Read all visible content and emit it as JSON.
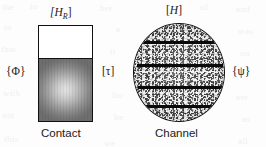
{
  "figure": {
    "width": 266,
    "height": 147,
    "background_color": "#fdfdfd",
    "ink_color": "#101010"
  },
  "contact": {
    "top_label": "[H",
    "top_label_sub": "R",
    "top_label_close": "]",
    "left_label": "{Φ}",
    "right_label": "[τ]",
    "caption": "Contact",
    "shape": "rectangle",
    "upper_region_fill": "#ffffff",
    "lower_region_fill": "radial-gray-gradient",
    "gradient_edge_color": "#6e6e6e",
    "gradient_center_color": "#e2e2e2"
  },
  "channel": {
    "top_label_open": "[",
    "top_label_var": "H",
    "top_label_close": "]",
    "right_label": "{ψ}",
    "caption": "Channel",
    "shape": "circle",
    "texture": "speckled-stipple",
    "bar_color": "#0a0a0a",
    "bar_count": 4,
    "bars": [
      {
        "top": 17,
        "left": 7,
        "width": 78
      },
      {
        "top": 40,
        "left": 3,
        "width": 86
      },
      {
        "top": 62,
        "left": 4,
        "width": 84
      },
      {
        "top": 81,
        "left": 10,
        "width": 72
      }
    ]
  },
  "bleed_through": [
    {
      "text": "the",
      "left": 2,
      "top": 2,
      "size": 9
    },
    {
      "text": "to",
      "left": 30,
      "top": 1,
      "size": 9
    },
    {
      "text": "her",
      "left": 100,
      "top": 3,
      "size": 9
    },
    {
      "text": "of",
      "left": 200,
      "top": 2,
      "size": 9
    },
    {
      "text": "and",
      "left": 236,
      "top": 4,
      "size": 9
    },
    {
      "text": "in",
      "left": 4,
      "top": 22,
      "size": 9
    },
    {
      "text": "a",
      "left": 116,
      "top": 24,
      "size": 9
    },
    {
      "text": "was",
      "left": 238,
      "top": 26,
      "size": 9
    },
    {
      "text": "that",
      "left": 1,
      "top": 44,
      "size": 9
    },
    {
      "text": "it",
      "left": 110,
      "top": 46,
      "size": 9
    },
    {
      "text": "on",
      "left": 240,
      "top": 48,
      "size": 9
    },
    {
      "text": "with",
      "left": 3,
      "top": 88,
      "size": 9
    },
    {
      "text": "for",
      "left": 112,
      "top": 90,
      "size": 9
    },
    {
      "text": "are",
      "left": 236,
      "top": 92,
      "size": 9
    },
    {
      "text": "not",
      "left": 2,
      "top": 110,
      "size": 9
    },
    {
      "text": "be",
      "left": 114,
      "top": 112,
      "size": 9
    },
    {
      "text": "as",
      "left": 242,
      "top": 114,
      "size": 9
    },
    {
      "text": "this",
      "left": 4,
      "top": 134,
      "size": 9
    },
    {
      "text": "we",
      "left": 104,
      "top": 138,
      "size": 9
    },
    {
      "text": "all",
      "left": 238,
      "top": 136,
      "size": 9
    }
  ]
}
